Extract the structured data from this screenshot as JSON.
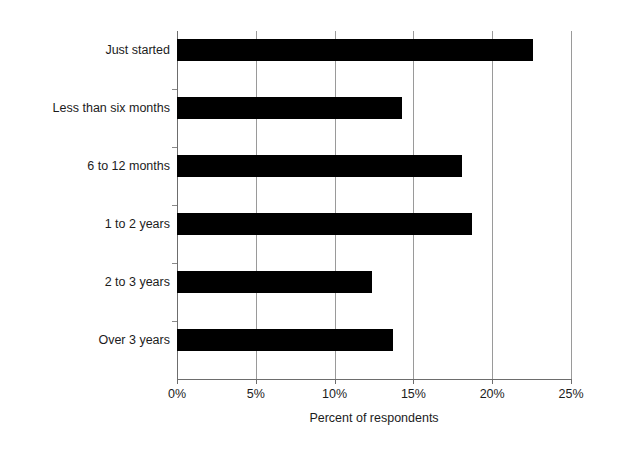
{
  "chart_data": {
    "type": "bar",
    "orientation": "horizontal",
    "title": "",
    "xlabel": "Percent of respondents",
    "ylabel": "",
    "categories": [
      "Just started",
      "Less than six months",
      "6 to 12 months",
      "1 to 2 years",
      "2 to 3 years",
      "Over 3 years"
    ],
    "values": [
      22.6,
      14.3,
      18.1,
      18.7,
      12.4,
      13.7
    ],
    "xlim": [
      0,
      25
    ],
    "xticks": [
      0,
      5,
      10,
      15,
      20,
      25
    ],
    "xtick_labels": [
      "0%",
      "5%",
      "10%",
      "15%",
      "20%",
      "25%"
    ],
    "grid": "vertical",
    "legend": "none",
    "bar_color": "#000000",
    "gridline_color": "#9a9a9a",
    "axis_color": "#6d6d6d",
    "background_color": "#ffffff"
  }
}
